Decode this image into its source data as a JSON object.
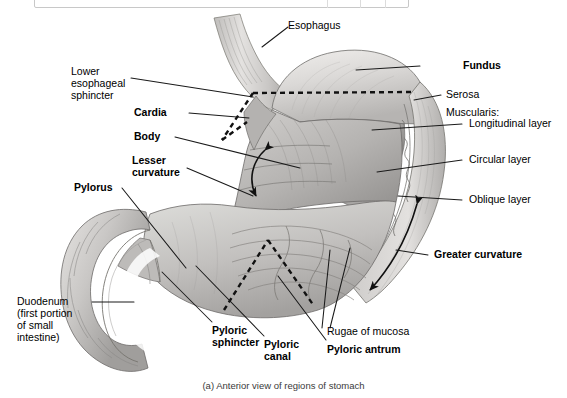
{
  "toolbar": {
    "clipped_text": "",
    "visible": true
  },
  "figure": {
    "caption": "(a) Anterior view of regions of stomach",
    "style": "grayscale-anatomical-illustration"
  },
  "labels": {
    "esophagus": "Esophagus",
    "lower_esophageal_sphincter_l1": "Lower",
    "lower_esophageal_sphincter_l2": "esophageal",
    "lower_esophageal_sphincter_l3": "sphincter",
    "cardia": "Cardia",
    "body": "Body",
    "lesser_curvature_l1": "Lesser",
    "lesser_curvature_l2": "curvature",
    "pylorus": "Pylorus",
    "duodenum_l1": "Duodenum",
    "duodenum_l2": "(first portion",
    "duodenum_l3": "of small",
    "duodenum_l4": "intestine)",
    "fundus": "Fundus",
    "serosa": "Serosa",
    "muscularis": "Muscularis:",
    "longitudinal_layer": "Longitudinal layer",
    "circular_layer": "Circular layer",
    "oblique_layer": "Oblique layer",
    "greater_curvature": "Greater curvature",
    "pyloric_sphincter_l1": "Pyloric",
    "pyloric_sphincter_l2": "sphincter",
    "pyloric_canal_l1": "Pyloric",
    "pyloric_canal_l2": "canal",
    "pyloric_antrum": "Pyloric antrum",
    "rugae_of_mucosa": "Rugae of mucosa"
  },
  "colors": {
    "background": "#ffffff",
    "label_text": "#000000",
    "caption_text": "#3a3a3a",
    "leader_line": "#1a1a1a",
    "dashed_boundary": "#111111",
    "tissue_light": "#e2e0de",
    "tissue_mid": "#c3c1bf",
    "tissue_dark": "#9a9896",
    "tissue_darker": "#7c7a78",
    "outline": "#6d6b69"
  }
}
